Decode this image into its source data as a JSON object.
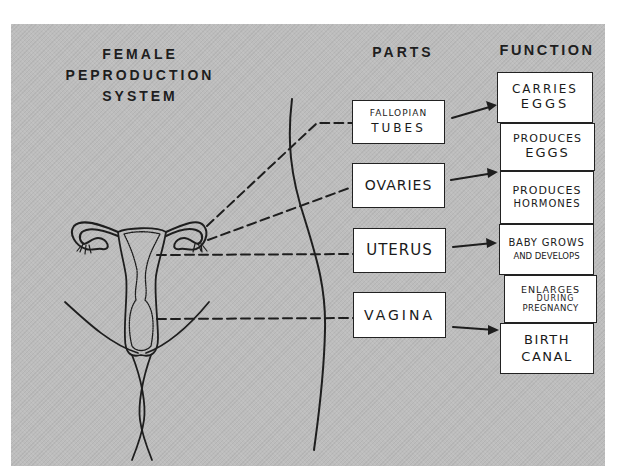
{
  "title": {
    "line1": "FEMALE",
    "line2": "PEPRODUCTION",
    "line3": "SYSTEM"
  },
  "headings": {
    "parts": "PARTS",
    "function": "FUNCTION"
  },
  "parts": [
    {
      "line1": "Fallopian",
      "line2": "Tubes"
    },
    {
      "line1": "Ovaries"
    },
    {
      "line1": "Uterus"
    },
    {
      "line1": "Vagina"
    }
  ],
  "functions": [
    {
      "line1": "Carries",
      "line2": "Eggs"
    },
    {
      "line1": "Produces",
      "line2": "Eggs"
    },
    {
      "line1": "Produces",
      "line2": "Hormones"
    },
    {
      "line1": "Baby Grows",
      "line2": "and Develops"
    },
    {
      "line1": "Enlarges",
      "line2": "During",
      "line3": "Pregnancy"
    },
    {
      "line1": "Birth",
      "line2": "Canal"
    }
  ],
  "colors": {
    "background": "#bdbdbd",
    "ink": "#1e1e1e",
    "box_fill": "#ffffff"
  }
}
